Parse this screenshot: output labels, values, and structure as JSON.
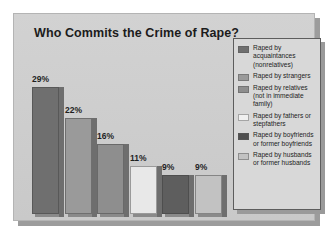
{
  "chart_data": {
    "type": "bar",
    "title": "Who Commits the Crime of Rape?",
    "xlabel": "",
    "ylabel": "",
    "ylim": [
      0,
      32
    ],
    "grid": false,
    "legend_position": "right",
    "categories": [
      "Raped by acquaintances (nonrelatives)",
      "Raped by strangers",
      "Raped by relatives (not in immediate family)",
      "Raped by fathers or stepfathers",
      "Raped by boyfriends or former boyfriends",
      "Raped by husbands or former husbands"
    ],
    "values": [
      29,
      22,
      16,
      11,
      9,
      9
    ],
    "value_labels": [
      "29%",
      "22%",
      "16%",
      "11%",
      "9%",
      "9%"
    ],
    "colors": [
      "#6f6f6f",
      "#9a9a9a",
      "#8e8e8e",
      "#e8e8e8",
      "#5e5e5e",
      "#c2c2c2"
    ]
  },
  "legend": {
    "items": [
      {
        "label": "Raped by acquaintances (nonrelatives)",
        "color": "#6f6f6f"
      },
      {
        "label": "Raped by strangers",
        "color": "#9a9a9a"
      },
      {
        "label": "Raped by relatives (not in immediate family)",
        "color": "#8e8e8e"
      },
      {
        "label": "Raped by fathers or stepfathers",
        "color": "#f0f0f0"
      },
      {
        "label": "Raped by boyfriends or former boyfriends",
        "color": "#4f4f4f"
      },
      {
        "label": "Raped by husbands or former husbands",
        "color": "#c2c2c2"
      }
    ]
  },
  "theme": {
    "panel_background": "#cfcfcf",
    "legend_background": "#d8d8d8",
    "text_color": "#1d1d1d"
  }
}
